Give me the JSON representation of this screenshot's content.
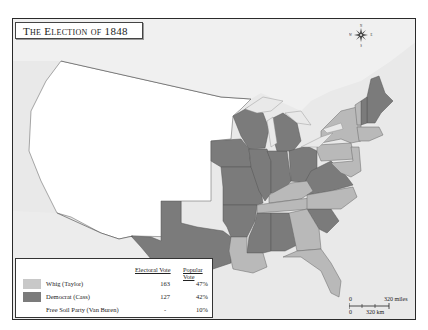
{
  "title": "The Election of 1848",
  "colors": {
    "whig": "#b9b9b9",
    "democrat": "#7b7b7b",
    "free_soil": "#ffffff",
    "territory": "#ffffff",
    "foreign_land": "#e9e9e9",
    "water": "#e9e9e9",
    "border": "#555555"
  },
  "legend": {
    "headers": {
      "electoral_vote": "Electoral Vote",
      "popular_vote": "Popular Vote"
    },
    "rows": [
      {
        "party": "Whig (Taylor)",
        "electoral_vote": "163",
        "popular_vote": "47%",
        "color_key": "whig"
      },
      {
        "party": "Democrat (Cass)",
        "electoral_vote": "127",
        "popular_vote": "42%",
        "color_key": "democrat"
      },
      {
        "party": "Free Soil Party (Van Buren)",
        "electoral_vote": "-",
        "popular_vote": "10%",
        "color_key": "none"
      }
    ]
  },
  "scale": {
    "zero_top": "0",
    "miles_label": "320 miles",
    "zero_bottom": "0",
    "km_label": "320 km"
  },
  "compass": {
    "n": "N",
    "s": "S",
    "e": "E",
    "w": "W"
  },
  "states": {
    "democrat": [
      "Maine",
      "New Hampshire",
      "Wisconsin",
      "Iowa",
      "Illinois",
      "Indiana",
      "Michigan",
      "Ohio",
      "Missouri",
      "Arkansas",
      "Texas",
      "Mississippi",
      "Alabama",
      "Virginia",
      "South Carolina"
    ],
    "whig": [
      "Vermont",
      "Massachusetts",
      "Rhode Island",
      "Connecticut",
      "New York",
      "New Jersey",
      "Pennsylvania",
      "Delaware",
      "Maryland",
      "Kentucky",
      "Tennessee",
      "North Carolina",
      "Georgia",
      "Louisiana",
      "Florida"
    ]
  }
}
